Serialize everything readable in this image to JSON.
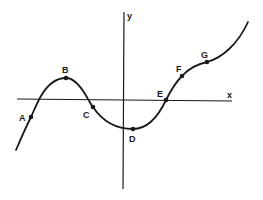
{
  "diagram": {
    "type": "function-graph",
    "axes": {
      "x_label": "x",
      "y_label": "y"
    },
    "points": [
      {
        "label": "A",
        "x": 31,
        "y": 117,
        "lx": 19,
        "ly": 121
      },
      {
        "label": "B",
        "x": 66,
        "y": 78,
        "lx": 62,
        "ly": 73
      },
      {
        "label": "C",
        "x": 93,
        "y": 107,
        "lx": 83,
        "ly": 118
      },
      {
        "label": "D",
        "x": 133,
        "y": 129,
        "lx": 129,
        "ly": 142
      },
      {
        "label": "E",
        "x": 166,
        "y": 100,
        "lx": 157,
        "ly": 97
      },
      {
        "label": "F",
        "x": 182,
        "y": 76,
        "lx": 176,
        "ly": 72
      },
      {
        "label": "G",
        "x": 207,
        "y": 62,
        "lx": 201,
        "ly": 58
      }
    ],
    "colors": {
      "ink": "#1a1a1a",
      "background": "#ffffff"
    }
  }
}
